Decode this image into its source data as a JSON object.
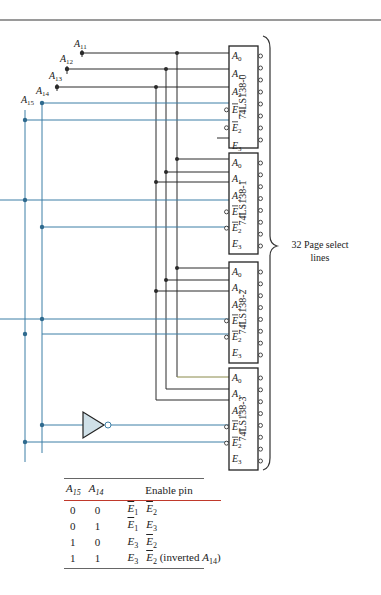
{
  "diagram": {
    "address_inputs": [
      "A11",
      "A12",
      "A13",
      "A14",
      "A15"
    ],
    "decoders": [
      {
        "name": "74LS138-0",
        "pins": [
          "A0",
          "A1",
          "A2",
          "E1",
          "E2",
          "E3"
        ]
      },
      {
        "name": "74LS138-1",
        "pins": [
          "A0",
          "A1",
          "A2",
          "E1",
          "E2",
          "E3"
        ]
      },
      {
        "name": "74LS138-2",
        "pins": [
          "A0",
          "A1",
          "A2",
          "E1",
          "E2",
          "E3"
        ]
      },
      {
        "name": "74LS138-3",
        "pins": [
          "A0",
          "A1",
          "A2",
          "E1",
          "E2",
          "E3"
        ]
      }
    ],
    "output_brace_label_line1": "32 Page select",
    "output_brace_label_line2": "lines",
    "colors": {
      "wire_black": "#2a2a2a",
      "wire_blue": "#3d7fa6",
      "inverter_fill": "#cfe0e8",
      "rule": "#999999",
      "table_header_rule": "#c0392b"
    }
  },
  "table": {
    "headers": [
      "A15",
      "A14",
      "Enable pin"
    ],
    "rows": [
      {
        "a15": "0",
        "a14": "0",
        "pin1": "E1",
        "pin1_bar": true,
        "pin2": "E2",
        "pin2_bar": true,
        "note": ""
      },
      {
        "a15": "0",
        "a14": "1",
        "pin1": "E1",
        "pin1_bar": true,
        "pin2": "E3",
        "pin2_bar": false,
        "note": ""
      },
      {
        "a15": "1",
        "a14": "0",
        "pin1": "E3",
        "pin1_bar": false,
        "pin2": "E2",
        "pin2_bar": true,
        "note": ""
      },
      {
        "a15": "1",
        "a14": "1",
        "pin1": "E3",
        "pin1_bar": false,
        "pin2": "E2",
        "pin2_bar": true,
        "note": "(inverted A14)"
      }
    ]
  }
}
